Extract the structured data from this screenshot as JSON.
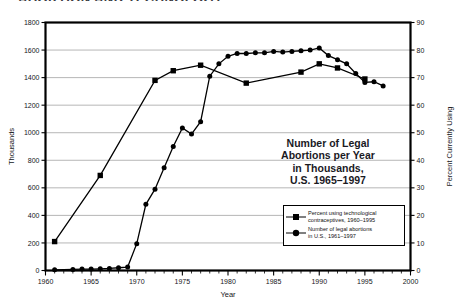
{
  "page_title": "ABORTION AND TECHNOLOGY",
  "inner_title_lines": [
    "Number of Legal",
    "Abortions per Year",
    "in Thousands,",
    "U.S. 1965–1997"
  ],
  "legend": {
    "entries": [
      {
        "marker": "square-marker",
        "label_lines": [
          "Percent using technological",
          "contraceptives, 1960–1995"
        ]
      },
      {
        "marker": "circle-marker",
        "label_lines": [
          "Number of legal abortions",
          "in U.S., 1961–1997"
        ]
      }
    ]
  },
  "chart_data": {
    "type": "line",
    "title": "Number of Legal Abortions per Year in Thousands, U.S. 1965–1997",
    "xlabel": "Year",
    "ylabel": "Thousands",
    "y2label": "Percent Currently Using",
    "xlim": [
      1960,
      2000
    ],
    "ylim": [
      0,
      1800
    ],
    "y2lim": [
      0,
      90
    ],
    "grid": true,
    "grid_axis": "y",
    "legend_position": "inside-right",
    "xticks": [
      1960,
      1965,
      1970,
      1975,
      1980,
      1985,
      1990,
      1995,
      2000
    ],
    "xminor_step": 1,
    "yticks": [
      0,
      200,
      400,
      600,
      800,
      1000,
      1200,
      1400,
      1600,
      1800
    ],
    "y2ticks": [
      0,
      10,
      20,
      30,
      40,
      50,
      60,
      70,
      80,
      90
    ],
    "series": [
      {
        "name": "Percent using technological contraceptives, 1960–1995",
        "marker": "square",
        "axis": "right",
        "units": "percent",
        "points": [
          {
            "x": 1961,
            "y": 10.5
          },
          {
            "x": 1966,
            "y": 34.5
          },
          {
            "x": 1972,
            "y": 69.0
          },
          {
            "x": 1974,
            "y": 72.5
          },
          {
            "x": 1977,
            "y": 74.5
          },
          {
            "x": 1982,
            "y": 68.0
          },
          {
            "x": 1988,
            "y": 72.0
          },
          {
            "x": 1990,
            "y": 75.0
          },
          {
            "x": 1992,
            "y": 73.5
          },
          {
            "x": 1995,
            "y": 69.5
          }
        ]
      },
      {
        "name": "Number of legal abortions in U.S., 1961–1997",
        "marker": "circle",
        "axis": "left",
        "units": "thousands",
        "points": [
          {
            "x": 1961,
            "y": 5
          },
          {
            "x": 1963,
            "y": 8
          },
          {
            "x": 1964,
            "y": 10
          },
          {
            "x": 1965,
            "y": 10
          },
          {
            "x": 1966,
            "y": 12
          },
          {
            "x": 1967,
            "y": 15
          },
          {
            "x": 1968,
            "y": 20
          },
          {
            "x": 1969,
            "y": 25
          },
          {
            "x": 1970,
            "y": 195
          },
          {
            "x": 1971,
            "y": 480
          },
          {
            "x": 1972,
            "y": 590
          },
          {
            "x": 1973,
            "y": 745
          },
          {
            "x": 1974,
            "y": 900
          },
          {
            "x": 1975,
            "y": 1035
          },
          {
            "x": 1976,
            "y": 990
          },
          {
            "x": 1977,
            "y": 1080
          },
          {
            "x": 1978,
            "y": 1410
          },
          {
            "x": 1979,
            "y": 1500
          },
          {
            "x": 1980,
            "y": 1555
          },
          {
            "x": 1981,
            "y": 1575
          },
          {
            "x": 1982,
            "y": 1575
          },
          {
            "x": 1983,
            "y": 1580
          },
          {
            "x": 1984,
            "y": 1580
          },
          {
            "x": 1985,
            "y": 1590
          },
          {
            "x": 1986,
            "y": 1585
          },
          {
            "x": 1987,
            "y": 1590
          },
          {
            "x": 1988,
            "y": 1595
          },
          {
            "x": 1989,
            "y": 1600
          },
          {
            "x": 1990,
            "y": 1615
          },
          {
            "x": 1991,
            "y": 1560
          },
          {
            "x": 1992,
            "y": 1530
          },
          {
            "x": 1993,
            "y": 1500
          },
          {
            "x": 1994,
            "y": 1430
          },
          {
            "x": 1995,
            "y": 1365
          },
          {
            "x": 1996,
            "y": 1370
          },
          {
            "x": 1997,
            "y": 1340
          }
        ]
      }
    ]
  }
}
